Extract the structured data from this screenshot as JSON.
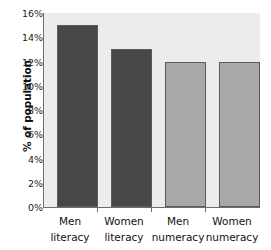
{
  "chart_data": {
    "type": "bar",
    "title": "",
    "xlabel": "",
    "ylabel": "% of population",
    "categories": [
      "Men literacy",
      "Women literacy",
      "Men numeracy",
      "Women numeracy"
    ],
    "category_lines": [
      [
        "Men",
        "literacy"
      ],
      [
        "Women",
        "literacy"
      ],
      [
        "Men",
        "numeracy"
      ],
      [
        "Women",
        "numeracy"
      ]
    ],
    "values": [
      15,
      13,
      12,
      12
    ],
    "value_labels": [
      "15%",
      "13%",
      "12%",
      "12%"
    ],
    "ylim": [
      0,
      16
    ],
    "ytick_values": [
      16,
      14,
      12,
      10,
      8,
      6,
      4,
      2,
      0
    ],
    "ytick_labels": [
      "16%",
      "14%",
      "12%",
      "10%",
      "8%",
      "6%",
      "4%",
      "2%",
      "0%"
    ],
    "grid": false,
    "legend": "none",
    "bar_colors": [
      "#474747",
      "#474747",
      "#a8a8a8",
      "#a8a8a8"
    ],
    "bar_edge_color": "#5a5a5a",
    "plot_background": "#ececec",
    "figure_background": "#ffffff",
    "axis_color": "#6d6d6d",
    "text_color": "#111111"
  }
}
